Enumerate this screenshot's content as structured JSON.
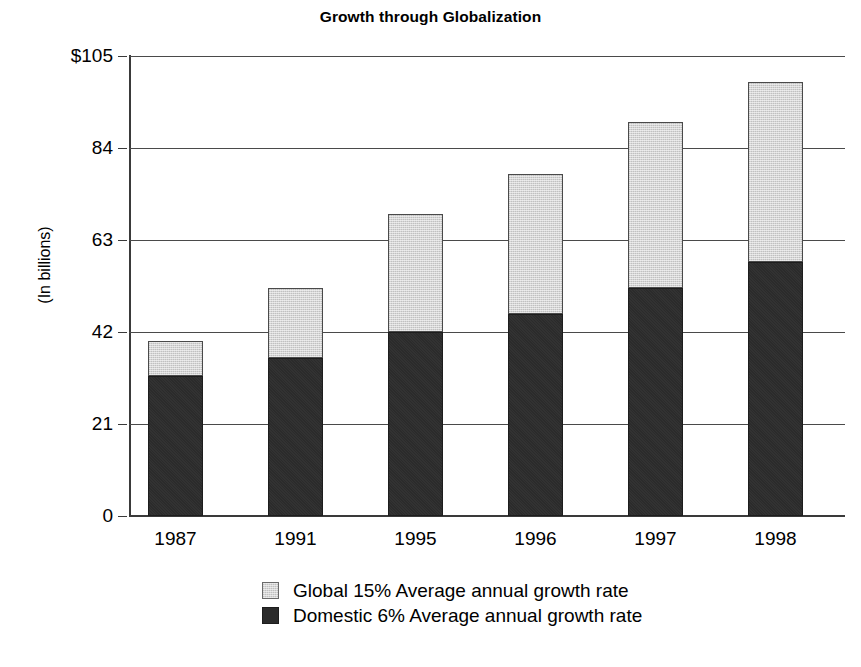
{
  "chart_data": {
    "type": "bar",
    "subtype": "stacked-bar",
    "title": "Growth through Globalization",
    "xlabel": "",
    "ylabel": "(In billions)",
    "categories": [
      "1987",
      "1991",
      "1995",
      "1996",
      "1997",
      "1998"
    ],
    "series": [
      {
        "name": "Domestic 6% Average annual growth rate",
        "color": "#2b2b2b",
        "values": [
          32,
          36,
          42,
          46,
          52,
          58
        ]
      },
      {
        "name": "Global 15% Average annual growth rate",
        "color": "#d5d5d5",
        "values": [
          8,
          16,
          27,
          32,
          38,
          41
        ]
      }
    ],
    "totals": [
      40,
      52,
      69,
      78,
      90,
      99
    ],
    "ylim": [
      0,
      105
    ],
    "yticks": [
      0,
      21,
      42,
      63,
      84,
      105
    ],
    "ytick_labels": [
      "0",
      "21",
      "42",
      "63",
      "84",
      "$105"
    ],
    "grid": true,
    "legend_position": "bottom"
  },
  "legend": {
    "items": [
      {
        "label": "Global 15% Average annual growth rate",
        "swatch": "global"
      },
      {
        "label": "Domestic 6% Average annual growth rate",
        "swatch": "domestic"
      }
    ]
  }
}
